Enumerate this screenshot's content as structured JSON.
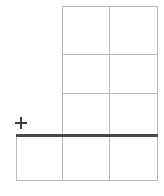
{
  "figure": {
    "canvas": {
      "width": 164,
      "height": 196,
      "background": "#ffffff"
    },
    "line_color": "#b9b9b9",
    "rule_color": "#4a4a4a",
    "mark_color": "#3d3d3d"
  },
  "upper_grid": {
    "name": "upper-grid",
    "left": 62,
    "top": 6,
    "right": 157,
    "bottom": 135,
    "columns": 2,
    "rows": 3,
    "column_divider_x": [
      109
    ],
    "row_divider_y": [
      54,
      93
    ],
    "cells": [
      {
        "row": 1,
        "column": 1,
        "value": ""
      },
      {
        "row": 1,
        "column": 2,
        "value": ""
      },
      {
        "row": 2,
        "column": 1,
        "value": ""
      },
      {
        "row": 2,
        "column": 2,
        "value": ""
      },
      {
        "row": 3,
        "column": 1,
        "value": ""
      },
      {
        "row": 3,
        "column": 2,
        "value": ""
      }
    ]
  },
  "lower_row": {
    "name": "lower-row",
    "left": 16,
    "top": 135,
    "right": 157,
    "bottom": 180,
    "columns": 3,
    "column_divider_x": [
      62,
      109
    ],
    "cells": [
      {
        "row": 4,
        "column": 0,
        "value": ""
      },
      {
        "row": 4,
        "column": 1,
        "value": ""
      },
      {
        "row": 4,
        "column": 2,
        "value": ""
      }
    ]
  },
  "separator_rule": {
    "name": "thick-separator-rule",
    "x1": 16,
    "x2": 158,
    "y": 134,
    "thickness": 3,
    "color": "#4a4a4a"
  },
  "plus_marker": {
    "name": "plus-marker",
    "glyph": "+",
    "center_x": 21,
    "center_y": 123,
    "size": 12,
    "color": "#3d3d3d"
  }
}
